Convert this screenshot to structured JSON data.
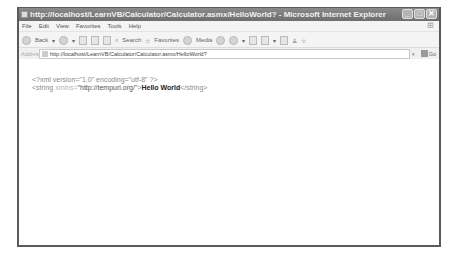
{
  "window": {
    "title": "http://localhost/LearnVB/Calculator/Calculator.asmx/HelloWorld? - Microsoft Internet Explorer",
    "controls": {
      "minimize": "_",
      "maximize": "□",
      "close": "✕"
    }
  },
  "menu": {
    "items": [
      "File",
      "Edit",
      "View",
      "Favorites",
      "Tools",
      "Help"
    ]
  },
  "toolbar": {
    "back_label": "Back",
    "search_label": "Search",
    "favorites_label": "Favorites",
    "media_label": "Media"
  },
  "address": {
    "label": "Address",
    "url": "http://localhost/LearnVB/Calculator/Calculator.asmx/HelloWorld?",
    "go_label": "Go"
  },
  "content": {
    "line1": "<?xml version=\"1.0\" encoding=\"utf-8\" ?>",
    "line2_open": "<string",
    "line2_attr": " xmlns=",
    "line2_url": "\"http://tempuri.org/\"",
    "line2_close_bracket": ">",
    "line2_value": "Hello World",
    "line2_end": "</string>"
  },
  "colors": {
    "frame": "#5a5a5a",
    "titlebar": "#7a7a7a",
    "chrome": "#f4f4f4"
  }
}
